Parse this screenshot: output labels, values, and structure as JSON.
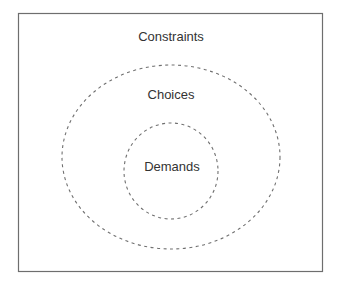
{
  "diagram": {
    "type": "nested-sets",
    "regions": [
      {
        "id": "constraints",
        "label": "Constraints",
        "shape": "rectangle",
        "border": "solid"
      },
      {
        "id": "choices",
        "label": "Choices",
        "shape": "ellipse",
        "border": "dashed"
      },
      {
        "id": "demands",
        "label": "Demands",
        "shape": "circle",
        "border": "dashed"
      }
    ],
    "colors": {
      "frame": "#6e6e6e",
      "dashed": "#707070",
      "text": "#333333",
      "background": "#ffffff"
    }
  }
}
